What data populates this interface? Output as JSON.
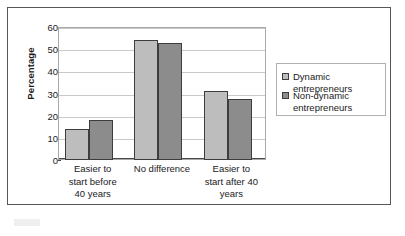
{
  "chart_data": {
    "type": "bar",
    "title": "",
    "subtitle": "",
    "xlabel": "",
    "ylabel": "Percentage",
    "ylim": [
      0,
      60
    ],
    "yticks": [
      0,
      10,
      20,
      30,
      40,
      50,
      60
    ],
    "ytick_labels": [
      "0",
      "10",
      "20",
      "30",
      "40",
      "50",
      "60"
    ],
    "grid": true,
    "grid_axis": "y",
    "legend_position": "right",
    "categories": [
      "Easier to\nstart before\n40 years",
      "No difference",
      "Easier to\nstart after 40\nyears"
    ],
    "category_labels": [
      "Easier to start before 40 years",
      "No difference",
      "Easier to start after 40 years"
    ],
    "series": [
      {
        "name": "Dynamic entrepreneurs",
        "color": "#bdbdbd",
        "values": [
          14,
          54,
          31
        ]
      },
      {
        "name": "Non-dynamic entrepreneurs",
        "color": "#8c8c8c",
        "values": [
          18,
          53,
          27.5
        ]
      }
    ]
  },
  "legend": {
    "entries": [
      {
        "label": "Dynamic entrepreneurs",
        "swatch": "legend-swatch-dynamic"
      },
      {
        "label": "Non-dynamic\nentrepreneurs",
        "swatch": "legend-swatch-non-dynamic"
      }
    ]
  },
  "colors": {
    "series_light": "#bdbdbd",
    "series_dark": "#8c8c8c",
    "frame_border": "#565656",
    "gridline": "#c9c9c9",
    "axis": "#4a4a4a",
    "text": "#1a1a1a",
    "background": "#ffffff"
  }
}
